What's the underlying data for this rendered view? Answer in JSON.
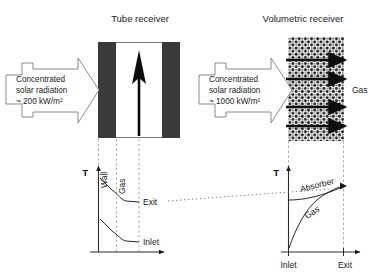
{
  "figure": {
    "type": "diagram"
  },
  "panels": {
    "left": {
      "title": "Tube receiver",
      "radiation_arrow": {
        "line1": "Concentrated",
        "line2": "solar radiation",
        "line3": "~ 200 kW/m²",
        "flux_value": "200",
        "flux_unit": "kW/m²",
        "direction": "right"
      },
      "receiver": {
        "kind": "tube",
        "wall_color": "#3a3a3a",
        "interior_color": "#ffffff",
        "flow_arrow_direction": "up"
      },
      "graph": {
        "y_axis_label": "T",
        "region_labels": [
          "Wall",
          "Gas"
        ],
        "curve_labels": [
          "Exit",
          "Inlet"
        ],
        "curves": [
          {
            "name": "Exit",
            "shape": "step-down",
            "start_level": "high",
            "end_level": "medium"
          },
          {
            "name": "Inlet",
            "shape": "step-down",
            "start_level": "medium",
            "end_level": "low"
          }
        ]
      }
    },
    "right": {
      "title": "Volumetric receiver",
      "radiation_arrow": {
        "line1": "Concentrated",
        "line2": "solar radiation",
        "line3": "~ 1000 kW/m²",
        "flux_value": "1000",
        "flux_unit": "kW/m²",
        "direction": "right"
      },
      "receiver": {
        "kind": "porous-absorber",
        "texture": "dotted-mesh",
        "gas_label": "Gas",
        "flow_arrow_count": 4,
        "flow_arrow_direction": "right"
      },
      "graph": {
        "y_axis_label": "T",
        "curve_labels": [
          "Absorber",
          "Gas"
        ],
        "x_tick_labels": [
          "Inlet",
          "Exit"
        ],
        "curves": [
          {
            "name": "Absorber",
            "shape": "rising-concave",
            "start_level": "medium",
            "end_level": "high"
          },
          {
            "name": "Gas",
            "shape": "rising-concave-steep",
            "start_level": "low",
            "end_level": "high"
          }
        ]
      }
    }
  },
  "connector": {
    "style": "dotted",
    "from": "left-graph-exit-level",
    "to": "right-graph-outlet-level"
  },
  "colors": {
    "ink": "#1a1a1a",
    "wall": "#3a3a3a",
    "guide": "#8a8a8a",
    "background": "#ffffff"
  }
}
